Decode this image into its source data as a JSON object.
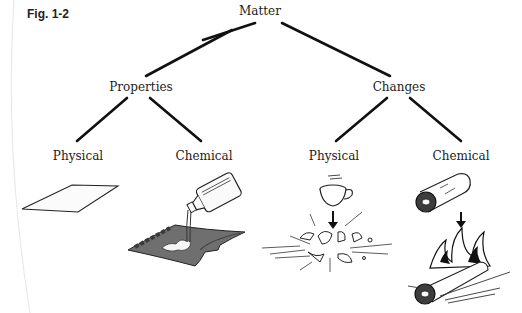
{
  "figure": {
    "label": "Fig. 1-2"
  },
  "tree": {
    "root": {
      "label": "Matter"
    },
    "properties": {
      "label": "Properties"
    },
    "changes": {
      "label": "Changes"
    },
    "properties_physical": {
      "label": "Physical"
    },
    "properties_chemical": {
      "label": "Chemical"
    },
    "changes_physical": {
      "label": "Physical"
    },
    "changes_chemical": {
      "label": "Chemical"
    }
  },
  "illustrations": {
    "properties_physical": "paper-sheet",
    "properties_chemical": "liquid-poured-on-fabric",
    "changes_physical": "cup-shattering",
    "changes_chemical": "log-burning"
  },
  "colors": {
    "line": "#111111",
    "fabric": "#6e6e6e",
    "text": "#222222"
  }
}
